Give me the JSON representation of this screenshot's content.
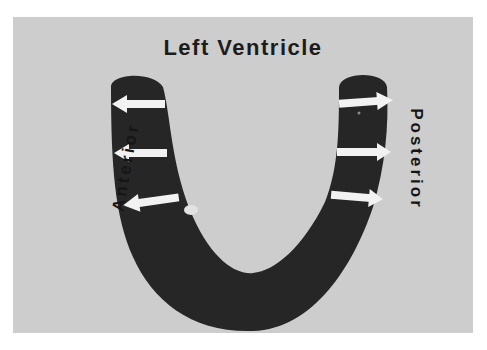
{
  "diagram": {
    "title": "Left Ventricle",
    "labels": {
      "anterior": "Anterior",
      "posterior": "Posterior"
    },
    "arrows": {
      "anterior_count": 3,
      "posterior_count": 3,
      "direction_anterior": "outward-left",
      "direction_posterior": "outward-right"
    },
    "colors": {
      "background": "#ffffff",
      "panel": "#cdcdcd",
      "wall": "#262626",
      "arrow": "#f2f2f2",
      "text": "#1c1c1c"
    }
  }
}
